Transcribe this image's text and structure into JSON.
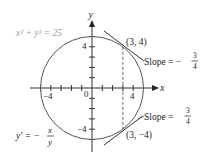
{
  "diagram": {
    "equation": "x² + y² = 25",
    "derivative": {
      "lhs": "y′ = −",
      "num": "x",
      "den": "y"
    },
    "axes": {
      "x_label": "x",
      "y_label": "y",
      "origin_label": "0"
    },
    "ticks": {
      "x_pos": "4",
      "x_neg": "−4",
      "y_pos": "4",
      "y_neg": "−4"
    },
    "points": [
      {
        "label": "(3, 4)",
        "x": 3,
        "y": 4
      },
      {
        "label": "(3, −4)",
        "x": 3,
        "y": -4
      }
    ],
    "slopes": [
      {
        "prefix": "Slope = −",
        "num": "3",
        "den": "4"
      },
      {
        "prefix": "Slope = ",
        "num": "3",
        "den": "4"
      }
    ],
    "colors": {
      "curve": "#555555",
      "axis": "#333333",
      "equation_text": "#9a9a9a"
    }
  }
}
